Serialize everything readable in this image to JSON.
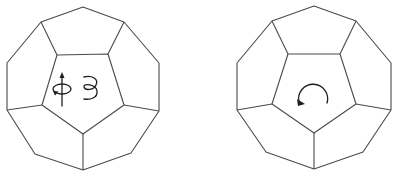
{
  "figure": {
    "description": "Two dodecahedra viewed face-on; left shows rotation axis and helical spin symbol, right shows circular rotation arrow",
    "colors": {
      "edge": "#4a4a4a",
      "icon": "#1e1e1e",
      "background": "#ffffff"
    },
    "panels": [
      {
        "id": "left",
        "shape": "dodecahedron",
        "center_face": "pentagon",
        "icons": [
          "axis-rotation-icon",
          "helix-icon"
        ],
        "outer": [
          [
            83,
            7
          ],
          [
            124,
            22
          ],
          [
            159,
            63
          ],
          [
            159,
            111
          ],
          [
            131,
            153
          ],
          [
            83,
            170
          ],
          [
            35,
            154
          ],
          [
            7,
            110
          ],
          [
            7,
            63
          ],
          [
            41,
            22
          ]
        ],
        "inner": [
          [
            57,
            55
          ],
          [
            108,
            54
          ],
          [
            124,
            105
          ],
          [
            83,
            134
          ],
          [
            42,
            105
          ]
        ]
      },
      {
        "id": "right",
        "shape": "dodecahedron",
        "center_face": "pentagon",
        "icons": [
          "circular-arrow-icon"
        ],
        "outer": [
          [
            314,
            6
          ],
          [
            356,
            21
          ],
          [
            391,
            63
          ],
          [
            391,
            110
          ],
          [
            363,
            152
          ],
          [
            314,
            169
          ],
          [
            266,
            152
          ],
          [
            237,
            110
          ],
          [
            237,
            63
          ],
          [
            272,
            21
          ]
        ],
        "inner": [
          [
            288,
            54
          ],
          [
            340,
            54
          ],
          [
            356,
            104
          ],
          [
            314,
            133
          ],
          [
            272,
            104
          ]
        ]
      }
    ]
  }
}
